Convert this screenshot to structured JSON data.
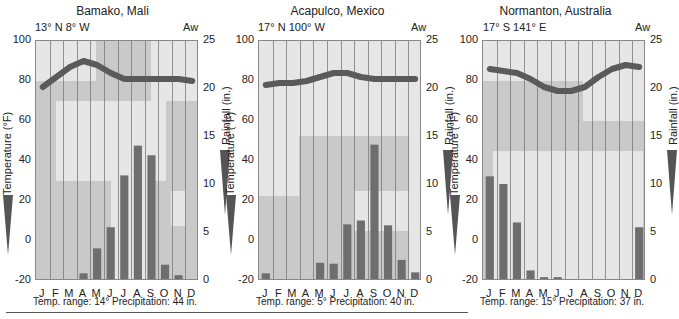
{
  "chart_data": [
    {
      "type": "bar+line",
      "title": "Bamako, Mali",
      "coordinates": "13° N  8° W",
      "climate_class": "Aw",
      "categories": [
        "J",
        "F",
        "M",
        "A",
        "M",
        "J",
        "J",
        "A",
        "S",
        "O",
        "N",
        "D"
      ],
      "series": [
        {
          "name": "Temperature (°F)",
          "type": "line",
          "axis": "left",
          "values": [
            77,
            82,
            87,
            90,
            88,
            84,
            81,
            81,
            81,
            81,
            81,
            80
          ]
        },
        {
          "name": "Rainfall (in.)",
          "type": "bar",
          "axis": "right",
          "values": [
            0.2,
            0.2,
            0.2,
            0.8,
            3.4,
            5.6,
            11.0,
            14.1,
            13.1,
            1.7,
            0.6,
            0.0
          ]
        }
      ],
      "ylabel_left": "Temperature (°F)",
      "ylabel_right": "Rainfall (in.)",
      "ylim_left": [
        -20,
        100
      ],
      "ylim_right": [
        0,
        25
      ],
      "yticks_left": [
        100,
        80,
        60,
        40,
        20,
        0,
        -20
      ],
      "yticks_right": [
        25,
        20,
        15,
        10,
        5,
        0
      ],
      "temp_range": "Temp. range: 14°",
      "precipitation": "Precipitation: 44 in."
    },
    {
      "type": "bar+line",
      "title": "Acapulco, Mexico",
      "coordinates": "17° N  100° W",
      "climate_class": "Aw",
      "categories": [
        "J",
        "F",
        "M",
        "A",
        "M",
        "J",
        "J",
        "A",
        "S",
        "O",
        "N",
        "D"
      ],
      "series": [
        {
          "name": "Temperature (°F)",
          "type": "line",
          "axis": "left",
          "values": [
            78,
            79,
            79,
            80,
            82,
            84,
            84,
            82,
            81,
            81,
            81,
            81
          ]
        },
        {
          "name": "Rainfall (in.)",
          "type": "bar",
          "axis": "right",
          "values": [
            0.8,
            0.0,
            0.0,
            0.0,
            1.9,
            1.8,
            5.9,
            6.3,
            14.2,
            5.8,
            2.2,
            0.9
          ]
        }
      ],
      "ylabel_left": "Temperature (°F)",
      "ylabel_right": "Rainfall (in.)",
      "ylim_left": [
        -20,
        100
      ],
      "ylim_right": [
        0,
        25
      ],
      "yticks_left": [
        100,
        80,
        60,
        40,
        20,
        0,
        -20
      ],
      "yticks_right": [
        25,
        20,
        15,
        10,
        5,
        0
      ],
      "temp_range": "Temp. range: 5°",
      "precipitation": "Precipitation: 40 in."
    },
    {
      "type": "bar+line",
      "title": "Normanton, Australia",
      "coordinates": "17° S  141° E",
      "climate_class": "Aw",
      "categories": [
        "J",
        "F",
        "M",
        "A",
        "M",
        "J",
        "J",
        "A",
        "S",
        "O",
        "N",
        "D"
      ],
      "series": [
        {
          "name": "Temperature (°F)",
          "type": "line",
          "axis": "left",
          "values": [
            86,
            85,
            84,
            81,
            77,
            75,
            75,
            77,
            82,
            86,
            88,
            87
          ]
        },
        {
          "name": "Rainfall (in.)",
          "type": "bar",
          "axis": "right",
          "values": [
            10.9,
            10.1,
            6.1,
            1.1,
            0.4,
            0.4,
            0.0,
            0.0,
            0.0,
            0.0,
            0.0,
            5.6
          ]
        }
      ],
      "ylabel_left": "Temperature (°F)",
      "ylabel_right": "Rainfall (in.)",
      "ylim_left": [
        -20,
        100
      ],
      "ylim_right": [
        0,
        25
      ],
      "yticks_left": [
        100,
        80,
        60,
        40,
        20,
        0,
        -20
      ],
      "yticks_right": [
        25,
        20,
        15,
        10,
        5,
        0
      ],
      "temp_range": "Temp. range: 15°",
      "precipitation": "Precipitation: 37 in."
    }
  ],
  "colors": {
    "temp_line": "#5a5a5a",
    "bar": "#6e6e6e",
    "ocean": "#c9c9c9",
    "land": "#e6e6e6",
    "grid": "#7a7a7a"
  }
}
